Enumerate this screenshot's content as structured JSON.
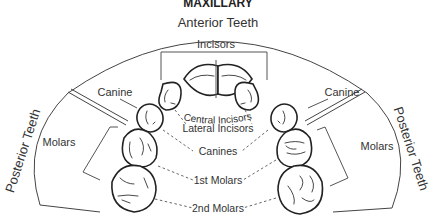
{
  "title": "MAXILLARY",
  "regions": {
    "anterior": "Anterior Teeth",
    "posterior_left": "Posterior Teeth",
    "posterior_right": "Posterior Teeth"
  },
  "groups": {
    "incisors": "Incisors",
    "canine_left": "Canine",
    "canine_right": "Canine",
    "molars_left": "Molars",
    "molars_right": "Molars"
  },
  "tooth_labels": {
    "central_incisors": "Central Incisors",
    "lateral_incisors": "Lateral Incisors",
    "canines": "Canines",
    "first_molars": "1st Molars",
    "second_molars": "2nd Molars"
  },
  "colors": {
    "line": "#444444",
    "text": "#333333",
    "tooth_outline": "#222222"
  }
}
